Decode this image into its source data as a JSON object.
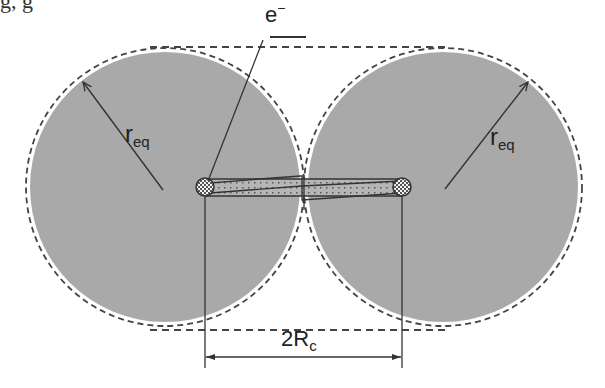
{
  "figure": {
    "type": "diagram",
    "top_cut_text": "g,                                          g",
    "labels": {
      "electron": "e",
      "electron_sup": "−",
      "radius_left": "r",
      "radius_left_sub": "eq",
      "radius_right": "r",
      "radius_right_sub": "eq",
      "separation": "2R",
      "separation_sub": "c"
    },
    "colors": {
      "disc_fill": "#a9a9a9",
      "line": "#333333",
      "dash": "#444444",
      "background": "#ffffff"
    },
    "geometry": {
      "left_center": [
        165,
        187
      ],
      "right_center": [
        443,
        187
      ],
      "disc_radius": 135,
      "envelope_top_y": 47,
      "envelope_bottom_y": 330,
      "atom_left": [
        205,
        187
      ],
      "atom_right": [
        402,
        187
      ],
      "atom_radius": 9,
      "dimension_y": 357
    }
  }
}
